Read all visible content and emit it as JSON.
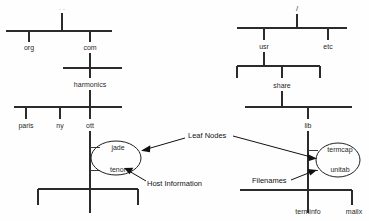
{
  "diagram": {
    "left_tree": {
      "name": "dns-domain-tree",
      "root_mark": ". .",
      "levels": [
        {
          "nodes": [
            "org",
            "com"
          ]
        },
        {
          "nodes": [
            "harmonics"
          ]
        },
        {
          "nodes": [
            "paris",
            "ny",
            "ott"
          ]
        },
        {
          "nodes": [
            "jade",
            "tenor"
          ]
        }
      ],
      "nodes": {
        "org": "org",
        "com": "com",
        "harmonics": "harmonics",
        "paris": "paris",
        "ny": "ny",
        "ott": "ott",
        "jade": "jade",
        "tenor": "tenor"
      }
    },
    "right_tree": {
      "name": "unix-filesystem-tree",
      "root_mark": "/",
      "levels": [
        {
          "nodes": [
            "usr",
            "etc"
          ]
        },
        {
          "nodes": [
            "share"
          ]
        },
        {
          "nodes": [
            "lib"
          ]
        },
        {
          "nodes": [
            "termcap",
            "unitab"
          ]
        },
        {
          "nodes": [
            "terminfo",
            "mailx"
          ]
        }
      ],
      "nodes": {
        "usr": "usr",
        "etc": "etc",
        "share": "share",
        "lib": "lib",
        "termcap": "termcap",
        "unitab": "unitab",
        "terminfo": "terminfo",
        "mailx": "mailx"
      }
    },
    "annotations": {
      "leaf_nodes": "Leaf Nodes",
      "host_information": "Host Information",
      "filenames": "Filenames"
    },
    "colors": {
      "line": "#2b2b2b",
      "text": "#2a2a2a",
      "annotation": "#141414",
      "background": "#fefefe"
    }
  }
}
